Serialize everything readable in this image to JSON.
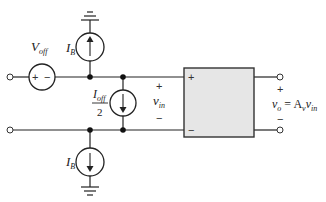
{
  "diagram": {
    "labels": {
      "v_off": {
        "main": "V",
        "sub": "off"
      },
      "ib_top": {
        "main": "I",
        "sub": "B"
      },
      "ib_bottom": {
        "main": "I",
        "sub": "B"
      },
      "ioff_half": {
        "num_main": "I",
        "num_sub": "off",
        "den": "2"
      },
      "vin": {
        "main": "v",
        "sub": "in"
      },
      "vout": {
        "lhs": "v",
        "lhs_sub": "o",
        "eq": " = A",
        "a_sub": "v",
        "v": "v",
        "v_sub": "in"
      }
    },
    "signs": {
      "plus": "+",
      "minus": "−"
    },
    "colors": {
      "wire": "#222222",
      "box_fill": "#e6e6e6",
      "box_stroke": "#333333",
      "node": "#111111"
    }
  }
}
